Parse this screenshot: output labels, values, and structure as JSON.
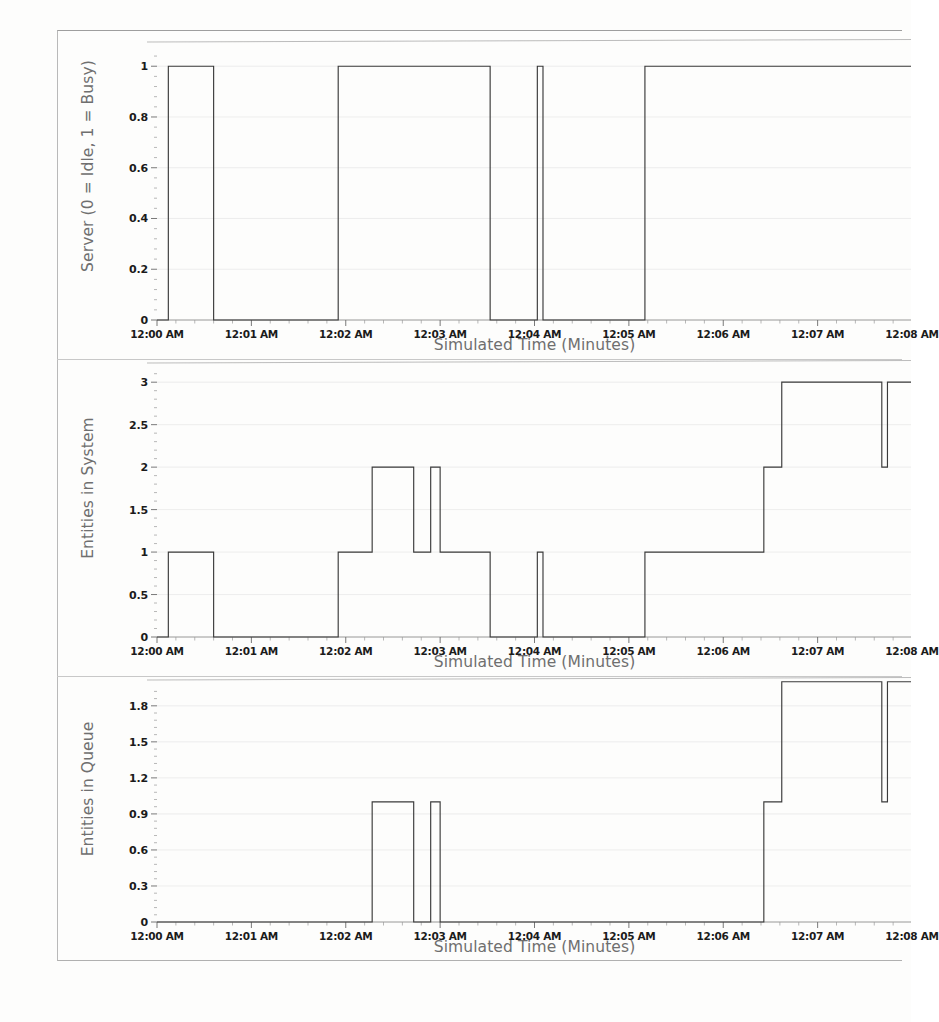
{
  "page": {
    "background_color": "#fdfdfc",
    "frame_color": "#b9b9b9",
    "line_color": "#3a3a3a",
    "grid_color": "#e8e8e8",
    "axis_label_color": "#6f6f6f",
    "tick_label_color": "#1b1b1b"
  },
  "shared": {
    "xlabel": "Simulated Time (Minutes)",
    "xticks": [
      "12:00 AM",
      "12:01 AM",
      "12:02 AM",
      "12:03 AM",
      "12:04 AM",
      "12:05 AM",
      "12:06 AM",
      "12:07 AM",
      "12:08 AM"
    ],
    "xlim": [
      0,
      8
    ],
    "minor_ticks_per_major": 5
  },
  "chart_data": [
    {
      "id": "server-utilization",
      "type": "line",
      "step": "post",
      "title": "",
      "xlabel": "Simulated Time (Minutes)",
      "ylabel": "Server (0 = Idle, 1 = Busy)",
      "xlim": [
        0,
        8
      ],
      "ylim": [
        0,
        1.06
      ],
      "yticks": [
        0,
        0.2,
        0.4,
        0.6,
        0.8,
        1
      ],
      "ytick_labels": [
        "0",
        "0.2",
        "0.4",
        "0.6",
        "0.8",
        "1"
      ],
      "xticks": [
        "12:00 AM",
        "12:01 AM",
        "12:02 AM",
        "12:03 AM",
        "12:04 AM",
        "12:05 AM",
        "12:06 AM",
        "12:07 AM",
        "12:08 AM"
      ],
      "grid": true,
      "legend": "none",
      "x": [
        0.0,
        0.12,
        0.12,
        0.6,
        0.6,
        1.92,
        1.92,
        3.53,
        3.53,
        4.03,
        4.03,
        4.09,
        4.09,
        5.17,
        5.17,
        8.0
      ],
      "y": [
        0,
        0,
        1,
        1,
        0,
        0,
        1,
        1,
        0,
        0,
        1,
        1,
        0,
        0,
        1,
        1
      ]
    },
    {
      "id": "entities-in-system",
      "type": "line",
      "step": "post",
      "title": "",
      "xlabel": "Simulated Time (Minutes)",
      "ylabel": "Entities in System",
      "xlim": [
        0,
        8
      ],
      "ylim": [
        0,
        3.12
      ],
      "yticks": [
        0,
        0.5,
        1,
        1.5,
        2,
        2.5,
        3
      ],
      "ytick_labels": [
        "0",
        "0.5",
        "1",
        "1.5",
        "2",
        "2.5",
        "3"
      ],
      "xticks": [
        "12:00 AM",
        "12:01 AM",
        "12:02 AM",
        "12:03 AM",
        "12:04 AM",
        "12:05 AM",
        "12:06 AM",
        "12:07 AM",
        "12:08 AM"
      ],
      "grid": true,
      "legend": "none",
      "x": [
        0.0,
        0.12,
        0.12,
        0.6,
        0.6,
        1.92,
        1.92,
        2.28,
        2.28,
        2.72,
        2.72,
        2.9,
        2.9,
        3.0,
        3.0,
        3.53,
        3.53,
        4.03,
        4.03,
        4.09,
        4.09,
        5.17,
        5.17,
        6.43,
        6.43,
        6.62,
        6.62,
        7.68,
        7.68,
        7.74,
        7.74,
        8.0
      ],
      "y": [
        0,
        0,
        1,
        1,
        0,
        0,
        1,
        1,
        2,
        2,
        1,
        1,
        2,
        2,
        1,
        1,
        0,
        0,
        1,
        1,
        0,
        0,
        1,
        1,
        2,
        2,
        3,
        3,
        2,
        2,
        3,
        3
      ]
    },
    {
      "id": "entities-in-queue",
      "type": "line",
      "step": "post",
      "title": "",
      "xlabel": "Simulated Time (Minutes)",
      "ylabel": "Entities in Queue",
      "xlim": [
        0,
        8
      ],
      "ylim": [
        0,
        1.94
      ],
      "yticks": [
        0,
        0.3,
        0.6,
        0.9,
        1.2,
        1.5,
        1.8
      ],
      "ytick_labels": [
        "0",
        "0.3",
        "0.6",
        "0.9",
        "1.2",
        "1.5",
        "1.8"
      ],
      "xticks": [
        "12:00 AM",
        "12:01 AM",
        "12:02 AM",
        "12:03 AM",
        "12:04 AM",
        "12:05 AM",
        "12:06 AM",
        "12:07 AM",
        "12:08 AM"
      ],
      "grid": true,
      "legend": "none",
      "x": [
        0.0,
        2.28,
        2.28,
        2.72,
        2.72,
        2.9,
        2.9,
        3.0,
        3.0,
        6.43,
        6.43,
        6.62,
        6.62,
        7.68,
        7.68,
        7.74,
        7.74,
        8.0
      ],
      "y": [
        0,
        0,
        1,
        1,
        0,
        0,
        1,
        1,
        0,
        0,
        1,
        1,
        2,
        2,
        1,
        1,
        2,
        2
      ]
    }
  ]
}
